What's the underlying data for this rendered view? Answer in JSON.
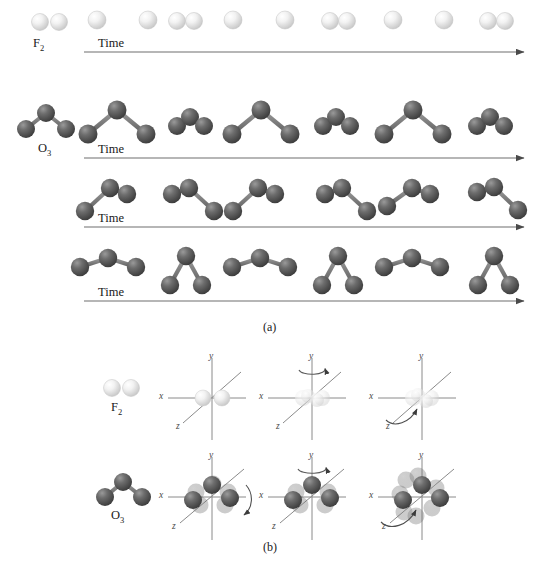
{
  "figure": {
    "panels": [
      {
        "id": "a",
        "caption": "(a)",
        "description": "vibrational modes"
      },
      {
        "id": "b",
        "caption": "(b)",
        "description": "rotational modes"
      }
    ]
  },
  "panel_a": {
    "time_label": "Time",
    "rows": [
      {
        "molecule_label": "F",
        "molecule_sub": "2",
        "mode": "stretching",
        "atom_color": "#e8e8e8",
        "frames": [
          "compressed",
          "extended",
          "compressed",
          "extended",
          "compressed",
          "extended",
          "compressed"
        ]
      },
      {
        "molecule_label": "O",
        "molecule_sub": "3",
        "mode": "symmetric-stretch",
        "atom_color": "#585858",
        "frames": [
          "short",
          "long",
          "short",
          "long",
          "short",
          "long",
          "short"
        ]
      },
      {
        "molecule_label": "",
        "molecule_sub": "",
        "mode": "asymmetric-stretch",
        "atom_color": "#585858",
        "frames": [
          "left-long",
          "right-long",
          "left-long",
          "right-long",
          "left-long",
          "right-long"
        ]
      },
      {
        "molecule_label": "",
        "molecule_sub": "",
        "mode": "bending",
        "atom_color": "#585858",
        "frames": [
          "open",
          "closed",
          "open",
          "closed",
          "open",
          "closed"
        ]
      }
    ]
  },
  "panel_b": {
    "axis_labels": {
      "x": "x",
      "y": "y",
      "z": "z"
    },
    "rows": [
      {
        "molecule_label": "F",
        "molecule_sub": "2",
        "atom_color": "#e8e8e8",
        "axes": [
          {
            "rotation_axis": "z-diagonal",
            "arrow": "none"
          },
          {
            "rotation_axis": "y",
            "arrow": "ellipse-top"
          },
          {
            "rotation_axis": "z",
            "arrow": "curved-lower-left"
          }
        ]
      },
      {
        "molecule_label": "O",
        "molecule_sub": "3",
        "atom_color": "#585858",
        "axes": [
          {
            "rotation_axis": "x-diagonal",
            "arrow": "curved-right"
          },
          {
            "rotation_axis": "y",
            "arrow": "ellipse-top"
          },
          {
            "rotation_axis": "z",
            "arrow": "curved-lower-left"
          }
        ]
      }
    ]
  },
  "colors": {
    "fluorine": "#e8e8e8",
    "oxygen": "#585858",
    "axis_line": "#7a7a7a",
    "arrow_line": "#5a5a5a",
    "bond": "#b8b8b8"
  }
}
